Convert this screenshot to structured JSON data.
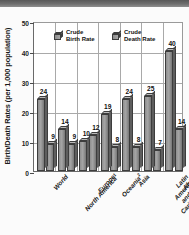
{
  "chart_data": {
    "type": "bar",
    "title": "",
    "xlabel": "",
    "ylabel": "Birth/Death Rates (per 1,000 population)",
    "ylim": [
      0,
      50
    ],
    "yticks": [
      0,
      10,
      20,
      30,
      40,
      50
    ],
    "grid": true,
    "legend_position": "top-inside",
    "categories": [
      "World",
      "North America",
      "Europe",
      "Oceania",
      "Asia",
      "Latin America and the Caribbean",
      "Africa"
    ],
    "category_display": [
      "World",
      "North America",
      "Europe",
      "Oceania",
      "Asia",
      "Latin America\nand the\nCaribbean",
      "Africa"
    ],
    "category_footnotes": [
      "",
      "1",
      "",
      "2",
      "",
      "",
      ""
    ],
    "series": [
      {
        "name": "Crude Birth Rate",
        "values": [
          24,
          14,
          10,
          19,
          24,
          25,
          40
        ]
      },
      {
        "name": "Crude Death Rate",
        "values": [
          9,
          9,
          12,
          8,
          8,
          7,
          14
        ]
      }
    ]
  },
  "legend": {
    "items": [
      {
        "label_line1": "Crude",
        "label_line2": "Birth Rate",
        "icon": "cube-icon"
      },
      {
        "label_line1": "Crude",
        "label_line2": "Death Rate",
        "icon": "cube-icon"
      }
    ]
  },
  "colors": {
    "bar_front": "#a5a5a5",
    "bar_side": "#5e5e5e",
    "bar_top": "#b9b9b9",
    "outline": "#3d3d3d",
    "grid": "#a9a9a9",
    "axis": "#6a6a6a",
    "text": "#111111",
    "top_band": "#6e6e6e",
    "plot_background": "#ffffff"
  }
}
